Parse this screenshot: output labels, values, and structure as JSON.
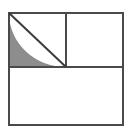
{
  "figure": {
    "title": "Shaded region inside subdivided square",
    "type": "geometry-diagram",
    "canvas": {
      "width": 132,
      "height": 134,
      "background": "#ffffff"
    },
    "colors": {
      "stroke": "#4a4a4a",
      "stroke_dark": "#3c3c3c",
      "shade_fill": "#8d8d8d",
      "background": "#ffffff"
    },
    "stroke_width": 2,
    "outer_square": {
      "label": "outer square",
      "x": 9,
      "y": 13,
      "width": 114,
      "height": 112
    },
    "vertical_divider": {
      "label": "vertical divider",
      "x": 66,
      "y1": 13,
      "y2": 67
    },
    "horizontal_divider": {
      "label": "horizontal divider",
      "y": 67,
      "x1": 9,
      "x2": 123
    },
    "diagonal": {
      "label": "diagonal chord",
      "x1": 9,
      "y1": 13,
      "x2": 66,
      "y2": 67
    },
    "shaded_region": {
      "label": "shaded region between arc and diagonal",
      "fill": "#8d8d8d",
      "arc_center_x": 66,
      "arc_center_y": 13,
      "arc_radius": 57,
      "path": "M 9 13 L 66 67 L 9 67 Z"
    },
    "quadrants": [
      {
        "name": "upper-left",
        "shaded": "yes"
      },
      {
        "name": "upper-right",
        "shaded": "no"
      },
      {
        "name": "lower",
        "shaded": "no"
      }
    ]
  }
}
